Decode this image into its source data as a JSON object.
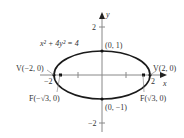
{
  "diagram": {
    "equation": "x² + 4y² = 4",
    "axes": {
      "x_label": "x",
      "y_label": "y"
    },
    "ticks": {
      "y_pos": "2",
      "y_neg": "−2",
      "x_pos": "2",
      "x_neg": "−2"
    },
    "points": {
      "top": "(0, 1)",
      "bottom": "(0, −1)",
      "vertex_left": "V(−2, 0)",
      "vertex_right": "V(2, 0)",
      "focus_left": "F(−√3, 0)",
      "focus_right": "F(√3, 0)"
    },
    "colors": {
      "curve": "#1a1a1a",
      "axis": "#888888",
      "text": "#333333"
    }
  }
}
